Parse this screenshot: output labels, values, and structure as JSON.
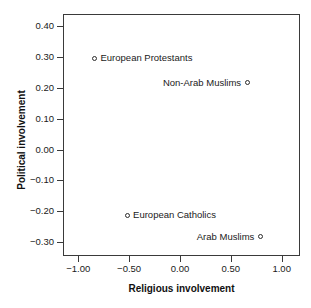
{
  "chart_data": {
    "type": "scatter",
    "title": "",
    "xlabel": "Religious involvement",
    "ylabel": "Political involvement",
    "xlim": [
      -1.15,
      1.18
    ],
    "ylim": [
      -0.345,
      0.44
    ],
    "grid": false,
    "legend": "none",
    "xticks": [
      "-1.00",
      "-0.50",
      "0.00",
      "0.50",
      "1.00"
    ],
    "xtick_values": [
      -1.0,
      -0.5,
      0.0,
      0.5,
      1.0
    ],
    "yticks": [
      "0.40",
      "0.30",
      "0.20",
      "0.10",
      "0.00",
      "-0.10",
      "-0.20",
      "-0.30"
    ],
    "ytick_values": [
      0.4,
      0.3,
      0.2,
      0.1,
      0.0,
      -0.1,
      -0.2,
      -0.3
    ],
    "marker": "open-circle",
    "marker_color": "#2b2b2b",
    "points": [
      {
        "label": "European Protestants",
        "x": -0.85,
        "y": 0.3,
        "label_side": "right"
      },
      {
        "label": "Non-Arab Muslims",
        "x": 0.65,
        "y": 0.22,
        "label_side": "left"
      },
      {
        "label": "European Catholics",
        "x": -0.53,
        "y": -0.21,
        "label_side": "right"
      },
      {
        "label": "Arab Muslims",
        "x": 0.78,
        "y": -0.28,
        "label_side": "left"
      }
    ]
  }
}
